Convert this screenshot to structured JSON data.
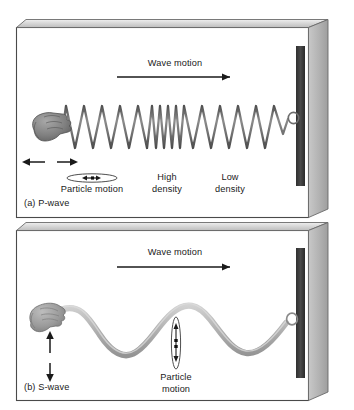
{
  "figure": {
    "caption_a": "(a)  P-wave",
    "caption_b": "(b)  S-wave"
  },
  "panel_a": {
    "wave_motion_label": "Wave motion",
    "particle_motion_label": "Particle motion",
    "high_density_label_line1": "High",
    "high_density_label_line2": "density",
    "low_density_label_line1": "Low",
    "low_density_label_line2": "density",
    "icons": {
      "hand": "hand-icon",
      "spring": "coil-spring-icon",
      "wave_arrow": "right-arrow-icon",
      "hand_motion_arrow": "double-horizontal-arrow-icon",
      "particle_ellipse": "horizontal-ellipse-icon",
      "wall_plate": "wall-anchor-plate-icon",
      "ring": "anchor-ring-icon"
    }
  },
  "panel_b": {
    "wave_motion_label": "Wave motion",
    "particle_motion_label_line1": "Particle",
    "particle_motion_label_line2": "motion",
    "icons": {
      "hand": "hand-icon",
      "rope": "sine-rope-icon",
      "wave_arrow": "right-arrow-icon",
      "hand_motion_arrow": "double-vertical-arrow-icon",
      "particle_ellipse": "vertical-ellipse-icon",
      "wall_plate": "wall-anchor-plate-icon",
      "ring": "anchor-ring-icon"
    }
  },
  "colors": {
    "frame_line": "#4a4a4a",
    "top_band": "#d0d0d0",
    "side_wall": "#b4b4b4",
    "plate_dark": "#3a3a3a",
    "spring": "#7d7d7d",
    "rope": "#b3b3b3",
    "hand": "#8d8d8d",
    "text": "#1a1a1a"
  }
}
